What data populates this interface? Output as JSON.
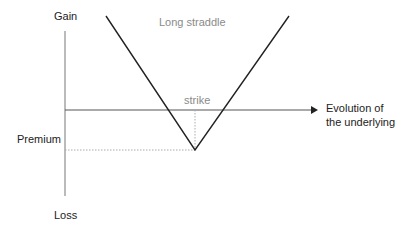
{
  "diagram": {
    "title": "Long straddle",
    "y_axis": {
      "top_label": "Gain",
      "bottom_label": "Loss"
    },
    "x_axis": {
      "label_line1": "Evolution of",
      "label_line2": "the underlying"
    },
    "annotations": {
      "strike": "strike",
      "premium": "Premium"
    },
    "colors": {
      "payoff_line": "#222222",
      "axis": "#666666",
      "guide": "#aaaaaa",
      "grey_text": "#8a8a8a"
    }
  }
}
